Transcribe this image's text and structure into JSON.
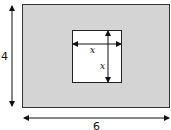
{
  "diagram": {
    "outer_rect": {
      "label_height": "4",
      "label_width": "6",
      "fill": "#d4d4d4",
      "stroke": "#333333"
    },
    "inner_square": {
      "label_width": "x",
      "label_height": "x",
      "fill": "#ffffff",
      "stroke": "#222222"
    }
  }
}
